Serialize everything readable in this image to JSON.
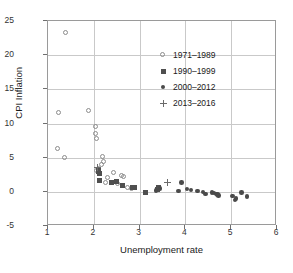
{
  "chart_data": {
    "type": "scatter",
    "title": "",
    "xlabel": "Unemployment rate",
    "ylabel": "CPI Inflation",
    "xlim": [
      1,
      6
    ],
    "ylim": [
      -5,
      25
    ],
    "xticks": [
      "1",
      "2",
      "3",
      "4",
      "5",
      "6"
    ],
    "yticks": [
      "25",
      "20",
      "15",
      "10",
      "5",
      "0",
      "-5"
    ],
    "grid": true,
    "legend_position": "upper-right-inside",
    "series": [
      {
        "name": "1971–1989",
        "marker": "open-circle",
        "color": "#8c8c8c",
        "points": [
          [
            1.4,
            23.2
          ],
          [
            1.23,
            11.5
          ],
          [
            1.9,
            11.9
          ],
          [
            1.22,
            6.3
          ],
          [
            1.38,
            4.9
          ],
          [
            2.05,
            9.5
          ],
          [
            2.05,
            8.5
          ],
          [
            2.06,
            7.8
          ],
          [
            2.2,
            5.1
          ],
          [
            2.22,
            4.3
          ],
          [
            2.18,
            3.9
          ],
          [
            2.45,
            2.8
          ],
          [
            2.3,
            2.0
          ],
          [
            2.26,
            1.3
          ],
          [
            2.52,
            1.2
          ],
          [
            2.62,
            2.3
          ],
          [
            2.66,
            2.1
          ],
          [
            2.74,
            0.6
          ],
          [
            2.84,
            0.4
          ],
          [
            2.12,
            3.3
          ],
          [
            2.08,
            3.1
          ]
        ]
      },
      {
        "name": "1990–1999",
        "marker": "filled-square",
        "color": "#4f4f4f",
        "points": [
          [
            2.1,
            3.3
          ],
          [
            2.1,
            3.0
          ],
          [
            2.12,
            2.7
          ],
          [
            2.13,
            1.7
          ],
          [
            2.38,
            1.3
          ],
          [
            2.5,
            1.5
          ],
          [
            2.62,
            0.9
          ],
          [
            2.85,
            0.7
          ],
          [
            2.88,
            0.6
          ],
          [
            3.12,
            -0.1
          ],
          [
            3.38,
            0.3
          ],
          [
            3.42,
            0.6
          ]
        ]
      },
      {
        "name": "2000–2012",
        "marker": "filled-circle",
        "color": "#4a4a4a",
        "points": [
          [
            3.36,
            0.2
          ],
          [
            3.45,
            0.5
          ],
          [
            3.85,
            0.1
          ],
          [
            3.92,
            1.4
          ],
          [
            4.04,
            0.4
          ],
          [
            4.12,
            0.3
          ],
          [
            4.26,
            0.1
          ],
          [
            4.38,
            0.0
          ],
          [
            4.44,
            -0.3
          ],
          [
            4.58,
            -0.1
          ],
          [
            4.62,
            -0.2
          ],
          [
            4.68,
            -0.3
          ],
          [
            4.72,
            -0.5
          ],
          [
            4.7,
            -0.4
          ],
          [
            5.03,
            -0.6
          ],
          [
            5.08,
            -1.2
          ],
          [
            5.1,
            -1.0
          ],
          [
            5.22,
            -0.1
          ],
          [
            5.35,
            -0.7
          ]
        ]
      },
      {
        "name": "2013–2016",
        "marker": "plus",
        "color": "#6a6a6a",
        "points": [
          [
            3.6,
            1.4
          ],
          [
            2.08,
            3.6
          ]
        ]
      }
    ]
  },
  "legend": {
    "entries": [
      {
        "label": "1971–1989",
        "marker": "open-circle"
      },
      {
        "label": "1990–1999",
        "marker": "filled-square"
      },
      {
        "label": "2000–2012",
        "marker": "filled-circle"
      },
      {
        "label": "2013–2016",
        "marker": "plus"
      }
    ]
  }
}
